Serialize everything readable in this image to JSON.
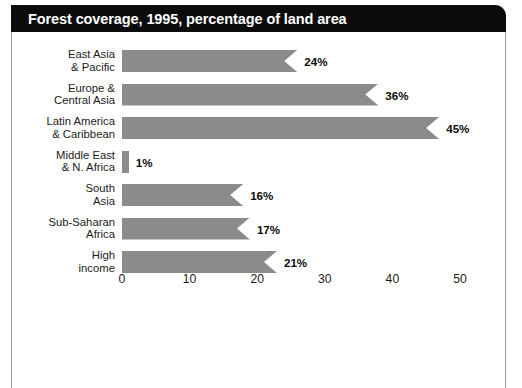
{
  "title": "Forest coverage, 1995, percentage of land area",
  "colors": {
    "title_bar_bg": "#0b0b0b",
    "title_text": "#ffffff",
    "bar_fill": "#8b8b8b",
    "text": "#1b1b1b",
    "frame_rule": "#9a9a9a",
    "page_bg": "#ffffff"
  },
  "chart_data": {
    "type": "bar",
    "orientation": "horizontal",
    "title": "Forest coverage, 1995, percentage of land area",
    "xlabel": "",
    "ylabel": "",
    "xlim": [
      0,
      50
    ],
    "grid": false,
    "legend": null,
    "categories": [
      "East Asia\n& Pacific",
      "Europe &\nCentral Asia",
      "Latin America\n& Caribbean",
      "Middle East\n& N. Africa",
      "South\nAsia",
      "Sub-Saharan\nAfrica",
      "High\nincome"
    ],
    "values": [
      24,
      36,
      45,
      1,
      16,
      17,
      21
    ],
    "value_labels": [
      "24%",
      "36%",
      "45%",
      "1%",
      "16%",
      "17%",
      "21%"
    ],
    "tick_values": [
      0,
      10,
      20,
      30,
      40,
      50
    ],
    "tick_labels": [
      "0",
      "10",
      "20",
      "30",
      "40",
      "50"
    ]
  }
}
